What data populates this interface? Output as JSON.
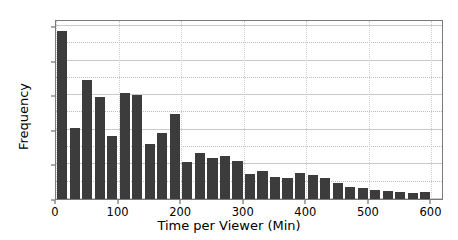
{
  "chart_data": {
    "type": "bar",
    "title": "",
    "xlabel": "Time per Viewer (Min)",
    "ylabel": "Frequency",
    "xlim": [
      0,
      620
    ],
    "ylim": [
      0,
      520
    ],
    "xticks": [
      0,
      100,
      200,
      300,
      400,
      500,
      600
    ],
    "yticks": [
      0,
      100,
      200,
      300,
      400,
      500
    ],
    "grid": true,
    "legend": null,
    "bar_color": "#3c3c3c",
    "bin_width": 20,
    "categories": [
      "0-20",
      "20-40",
      "40-60",
      "60-80",
      "80-100",
      "100-120",
      "120-140",
      "140-160",
      "160-180",
      "180-200",
      "200-220",
      "220-240",
      "240-260",
      "260-280",
      "280-300",
      "300-320",
      "320-340",
      "340-360",
      "360-380",
      "380-400",
      "400-420",
      "420-440",
      "440-460",
      "460-480",
      "480-500",
      "500-520",
      "520-540",
      "540-560",
      "560-580",
      "580-600"
    ],
    "bin_starts": [
      0,
      20,
      40,
      60,
      80,
      100,
      120,
      140,
      160,
      180,
      200,
      220,
      240,
      260,
      280,
      300,
      320,
      340,
      360,
      380,
      400,
      420,
      440,
      460,
      480,
      500,
      520,
      540,
      560,
      580
    ],
    "values": [
      485,
      205,
      345,
      295,
      182,
      305,
      300,
      158,
      190,
      245,
      108,
      132,
      118,
      125,
      110,
      72,
      82,
      65,
      60,
      75,
      70,
      62,
      47,
      36,
      32,
      25,
      22,
      20,
      18,
      20
    ]
  },
  "axes": {
    "ytick_labels": [
      "0",
      "100",
      "200",
      "300",
      "400",
      "500"
    ],
    "xtick_labels": [
      "0",
      "100",
      "200",
      "300",
      "400",
      "500",
      "600"
    ],
    "xlabel": "Time per Viewer (Min)",
    "ylabel": "Frequency"
  }
}
